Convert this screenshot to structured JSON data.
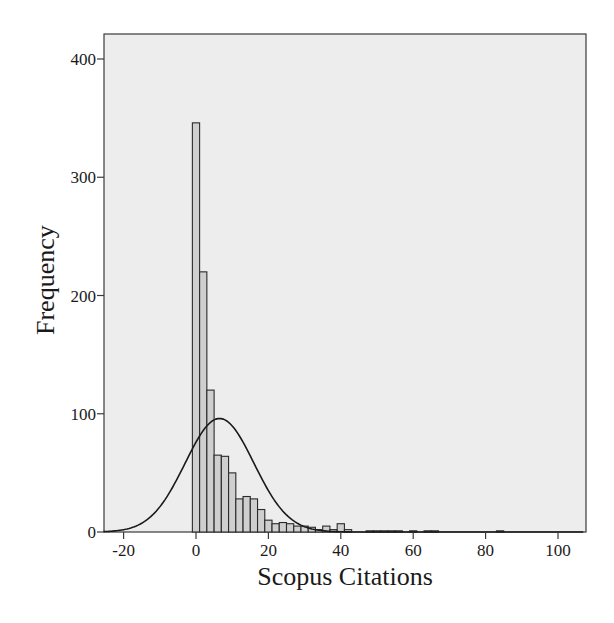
{
  "chart_data": {
    "type": "bar",
    "subtype": "histogram_with_normal_curve",
    "title": "",
    "xlabel": "Scopus Citations",
    "ylabel": "Frequency",
    "xlim": [
      -26,
      107
    ],
    "ylim": [
      0,
      420
    ],
    "x_ticks": [
      -20,
      0,
      20,
      40,
      60,
      80,
      100
    ],
    "y_ticks": [
      0,
      100,
      200,
      300,
      400
    ],
    "bin_width": 2,
    "bin_start": -1,
    "bins": [
      {
        "center": 0,
        "count": 346
      },
      {
        "center": 2,
        "count": 220
      },
      {
        "center": 4,
        "count": 120
      },
      {
        "center": 6,
        "count": 65
      },
      {
        "center": 8,
        "count": 64
      },
      {
        "center": 10,
        "count": 50
      },
      {
        "center": 12,
        "count": 28
      },
      {
        "center": 14,
        "count": 30
      },
      {
        "center": 16,
        "count": 28
      },
      {
        "center": 18,
        "count": 19
      },
      {
        "center": 20,
        "count": 10
      },
      {
        "center": 22,
        "count": 7
      },
      {
        "center": 24,
        "count": 8
      },
      {
        "center": 26,
        "count": 7
      },
      {
        "center": 28,
        "count": 5
      },
      {
        "center": 30,
        "count": 5
      },
      {
        "center": 32,
        "count": 4
      },
      {
        "center": 34,
        "count": 2
      },
      {
        "center": 36,
        "count": 5
      },
      {
        "center": 38,
        "count": 2
      },
      {
        "center": 40,
        "count": 7
      },
      {
        "center": 42,
        "count": 2
      },
      {
        "center": 48,
        "count": 1
      },
      {
        "center": 50,
        "count": 1
      },
      {
        "center": 52,
        "count": 1
      },
      {
        "center": 54,
        "count": 1
      },
      {
        "center": 56,
        "count": 1
      },
      {
        "center": 60,
        "count": 1
      },
      {
        "center": 64,
        "count": 1
      },
      {
        "center": 66,
        "count": 1
      },
      {
        "center": 84,
        "count": 1
      }
    ],
    "normal_curve": {
      "mean": 6.5,
      "sd": 9.5,
      "peak": 96
    },
    "grid": false,
    "legend": null,
    "colors": {
      "plot_background": "#ededed",
      "bar_fill": "#cfcfcf",
      "bar_edge": "#2a2a2a",
      "curve": "#1a1a1a",
      "frame": "#3a3a3a"
    }
  }
}
